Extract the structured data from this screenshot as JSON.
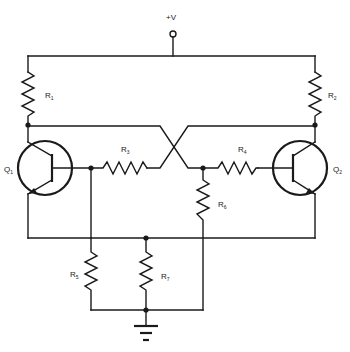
{
  "diagram": {
    "type": "circuit-schematic",
    "supply_label": "+V",
    "transistors": [
      {
        "id": "Q1",
        "label": "Q",
        "sub": "1"
      },
      {
        "id": "Q2",
        "label": "Q",
        "sub": "2"
      }
    ],
    "resistors": [
      {
        "id": "R1",
        "label": "R",
        "sub": "1"
      },
      {
        "id": "R2",
        "label": "R",
        "sub": "2"
      },
      {
        "id": "R3",
        "label": "R",
        "sub": "3"
      },
      {
        "id": "R4",
        "label": "R",
        "sub": "4"
      },
      {
        "id": "R5",
        "label": "R",
        "sub": "5"
      },
      {
        "id": "R6",
        "label": "R",
        "sub": "6"
      },
      {
        "id": "R7",
        "label": "R",
        "sub": "7"
      }
    ],
    "ground": "ground-symbol",
    "stroke_color": "#1a1a1a",
    "background": "#ffffff"
  }
}
